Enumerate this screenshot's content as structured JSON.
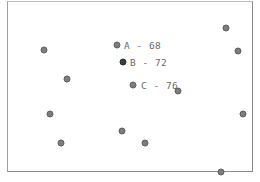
{
  "scene": {
    "labeled_points": [
      {
        "id": "A",
        "text": "A - 68",
        "x": 117,
        "y": 45,
        "dark": false
      },
      {
        "id": "B",
        "text": "B - 72",
        "x": 123,
        "y": 62,
        "dark": true
      },
      {
        "id": "C",
        "text": "C - 76",
        "x": 133,
        "y": 85,
        "dark": false
      }
    ],
    "points": [
      {
        "x": 44,
        "y": 50
      },
      {
        "x": 67,
        "y": 79
      },
      {
        "x": 226,
        "y": 28
      },
      {
        "x": 238,
        "y": 51
      },
      {
        "x": 178,
        "y": 91
      },
      {
        "x": 50,
        "y": 114
      },
      {
        "x": 61,
        "y": 143
      },
      {
        "x": 122,
        "y": 131
      },
      {
        "x": 145,
        "y": 143
      },
      {
        "x": 243,
        "y": 114
      },
      {
        "x": 221,
        "y": 172
      }
    ]
  }
}
